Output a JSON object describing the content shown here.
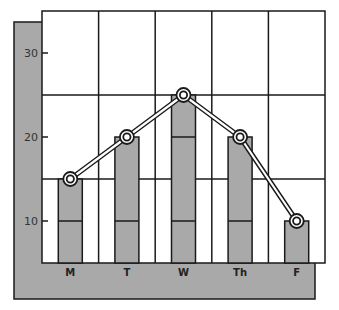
{
  "chart_data": {
    "type": "bar",
    "overlay": "line",
    "title": "",
    "xlabel": "",
    "ylabel": "",
    "categories": [
      "M",
      "T",
      "W",
      "Th",
      "F"
    ],
    "values": [
      15,
      20,
      25,
      20,
      10
    ],
    "series": [
      {
        "name": "bars",
        "type": "bar",
        "values": [
          15,
          20,
          25,
          20,
          10
        ]
      },
      {
        "name": "line",
        "type": "line",
        "values": [
          15,
          20,
          25,
          20,
          10
        ]
      }
    ],
    "y_ticks": [
      10,
      20,
      30
    ],
    "ylim": [
      5,
      35
    ],
    "grid": true,
    "legend": null
  },
  "colors": {
    "bar_fill": "#a9a9a9",
    "panel_fill": "#a9a9a9",
    "line": "#1a1a1a",
    "background": "#ffffff"
  }
}
